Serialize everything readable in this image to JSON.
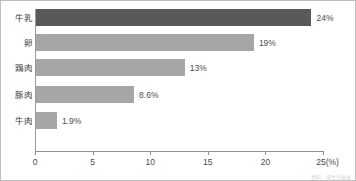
{
  "chart_data": {
    "type": "bar",
    "orientation": "horizontal",
    "title": "",
    "xlabel": "25(%)",
    "ylabel": "",
    "xlim": [
      0,
      25
    ],
    "grid": false,
    "legend": null,
    "categories": [
      "牛乳",
      "卵",
      "鶏肉",
      "豚肉",
      "牛肉"
    ],
    "values": [
      24,
      19,
      13,
      8.6,
      1.9
    ],
    "value_labels": [
      "24%",
      "19%",
      "13%",
      "8.6%",
      "1.9%"
    ],
    "bar_colors": [
      "#595959",
      "#a6a6a6",
      "#a6a6a6",
      "#a6a6a6",
      "#a6a6a6"
    ],
    "xticks": [
      0,
      5,
      10,
      15,
      20,
      25
    ],
    "xtick_labels": [
      "0",
      "5",
      "10",
      "15",
      "20",
      "25(%)"
    ],
    "axis_color": "#8f8f8f",
    "border_color": "#bfbfbf"
  },
  "footnote": {
    "text": "資料：厚生労働省"
  }
}
